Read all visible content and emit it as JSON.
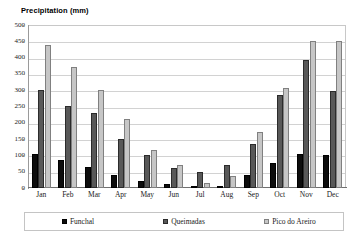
{
  "chart_data": {
    "type": "bar",
    "title": "Precipitation (mm)",
    "xlabel": "",
    "ylabel": "",
    "ylim": [
      0,
      500
    ],
    "yticks": [
      0,
      50,
      100,
      150,
      200,
      250,
      300,
      350,
      400,
      450,
      500
    ],
    "grid": true,
    "legend_position": "bottom",
    "categories": [
      "Jan",
      "Feb",
      "Mar",
      "Apr",
      "May",
      "Jun",
      "Jul",
      "Aug",
      "Sep",
      "Oct",
      "Nov",
      "Dec"
    ],
    "series": [
      {
        "name": "Funchal",
        "color": "#0d0d0d",
        "values": [
          103,
          87,
          64,
          40,
          20,
          13,
          4,
          4,
          39,
          76,
          104,
          102
        ]
      },
      {
        "name": "Queimadas",
        "color": "#585858",
        "values": [
          302,
          251,
          231,
          151,
          100,
          62,
          48,
          70,
          134,
          285,
          392,
          299
        ]
      },
      {
        "name": "Pico do Areiro",
        "color": "#c6c6c6",
        "values": [
          438,
          371,
          301,
          213,
          118,
          70,
          15,
          37,
          171,
          308,
          450,
          450
        ]
      }
    ]
  }
}
